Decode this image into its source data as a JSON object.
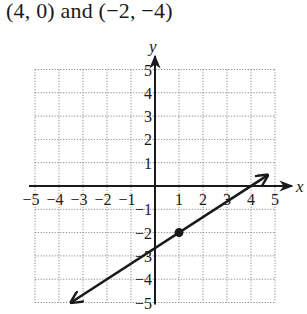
{
  "problem": {
    "title": "(4, 0) and (−2, −4)"
  },
  "chart_data": {
    "type": "line",
    "title": "(4, 0) and (−2, −4)",
    "xlabel": "x",
    "ylabel": "y",
    "xlim": [
      -5,
      5
    ],
    "ylim": [
      -5,
      5
    ],
    "grid": true,
    "grid_style": "dotted",
    "x_ticks": [
      -5,
      -4,
      -3,
      -2,
      -1,
      1,
      2,
      3,
      4,
      5
    ],
    "y_ticks": [
      -5,
      -4,
      -3,
      -2,
      -1,
      1,
      2,
      3,
      4,
      5
    ],
    "x_tick_labels": [
      "−5",
      "−4",
      "−3",
      "−2",
      "−1",
      "1",
      "2",
      "3",
      "4",
      "5"
    ],
    "y_tick_labels": [
      "−5",
      "−4",
      "−3",
      "−2",
      "−1",
      "1",
      "2",
      "3",
      "4",
      "5"
    ],
    "series": [
      {
        "name": "line through (4,0) and (-2,-4)",
        "kind": "line-with-arrows",
        "slope": 0.6667,
        "intercept": -2.6667,
        "x": [
          -3.5,
          4.7
        ],
        "y": [
          -5.0,
          0.47
        ]
      }
    ],
    "points": [
      {
        "x": 1,
        "y": -2,
        "style": "filled-dot"
      }
    ],
    "given_points": [
      {
        "x": 4,
        "y": 0
      },
      {
        "x": -2,
        "y": -4
      }
    ]
  }
}
